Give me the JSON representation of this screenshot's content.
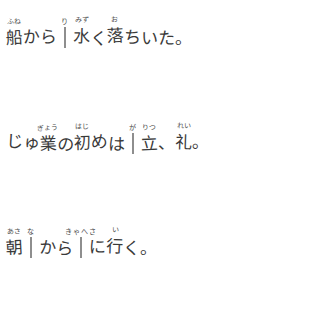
{
  "document": {
    "kind": "handwritten-japanese-worksheet",
    "background_color": "#ffffff",
    "ink_color": "#3a3a3a",
    "box_border_color": "#8e8e8e"
  },
  "lines": [
    {
      "id": "line-1",
      "tokens": [
        {
          "type": "text",
          "base": "船",
          "ruby": "ふね"
        },
        {
          "type": "text",
          "base": "から",
          "ruby": ""
        },
        {
          "type": "box",
          "base": "",
          "ruby": "り"
        },
        {
          "type": "text",
          "base": "水",
          "ruby": "みず"
        },
        {
          "type": "text",
          "base": "く",
          "ruby": ""
        },
        {
          "type": "text",
          "base": "落",
          "ruby": "お"
        },
        {
          "type": "text",
          "base": "ちいた。",
          "ruby": ""
        }
      ]
    },
    {
      "id": "line-2",
      "tokens": [
        {
          "type": "text",
          "base": "じゅ",
          "ruby": ""
        },
        {
          "type": "text",
          "base": "業",
          "ruby": "ぎょう"
        },
        {
          "type": "text",
          "base": "の",
          "ruby": ""
        },
        {
          "type": "text",
          "base": "初",
          "ruby": "はじ"
        },
        {
          "type": "text",
          "base": "め",
          "ruby": ""
        },
        {
          "type": "text",
          "base": "は",
          "ruby": ""
        },
        {
          "type": "box",
          "base": "",
          "ruby": "が"
        },
        {
          "type": "text",
          "base": "立",
          "ruby": "りつ"
        },
        {
          "type": "text",
          "base": "、",
          "ruby": ""
        },
        {
          "type": "text",
          "base": "礼",
          "ruby": "れい"
        },
        {
          "type": "text",
          "base": "。",
          "ruby": ""
        }
      ]
    },
    {
      "id": "line-3",
      "tokens": [
        {
          "type": "text",
          "base": "朝",
          "ruby": "あさ"
        },
        {
          "type": "box",
          "base": "",
          "ruby": "な"
        },
        {
          "type": "text",
          "base": "から",
          "ruby": ""
        },
        {
          "type": "box",
          "base": "",
          "ruby": "きゃへさ"
        },
        {
          "type": "text",
          "base": "に",
          "ruby": ""
        },
        {
          "type": "text",
          "base": "行",
          "ruby": "い"
        },
        {
          "type": "text",
          "base": "く。",
          "ruby": ""
        }
      ]
    }
  ],
  "labels": {
    "line1_name": "sentence-line-1",
    "line2_name": "sentence-line-2",
    "line3_name": "sentence-line-3",
    "box_name": "answer-box"
  }
}
